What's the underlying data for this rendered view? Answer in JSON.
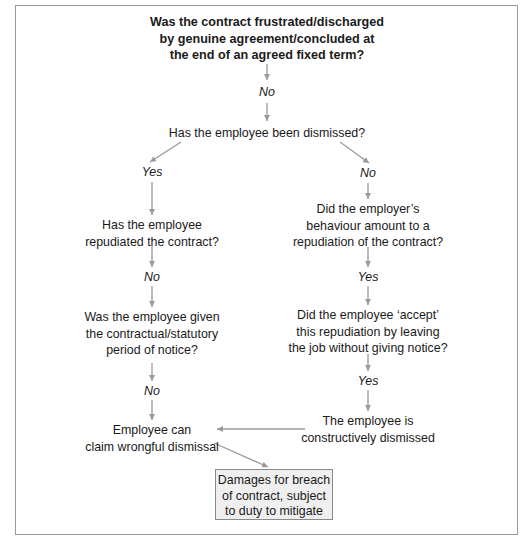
{
  "diagram": {
    "colors": {
      "arrow": "#9a9a9a",
      "box_fill": "#efefef",
      "text": "#1a1a1a",
      "frame": "#9a9a9a"
    },
    "start": {
      "lines": [
        "Was the contract frustrated/discharged",
        "by genuine agreement/concluded at",
        "the end of an agreed fixed term?"
      ]
    },
    "labels": {
      "start_no": "No",
      "dismissed_yes": "Yes",
      "dismissed_no": "No",
      "repudiated_no": "No",
      "employer_yes": "Yes",
      "notice_no": "No",
      "accept_yes": "Yes"
    },
    "nodes": {
      "dismissed": [
        "Has the employee been dismissed?"
      ],
      "repudiated": [
        "Has the employee",
        "repudiated the contract?"
      ],
      "notice": [
        "Was the employee given",
        "the contractual/statutory",
        "period of notice?"
      ],
      "wrongful": [
        "Employee can",
        "claim wrongful dismissal"
      ],
      "employer_behaviour": [
        "Did the employer’s",
        "behaviour amount to a",
        "repudiation of the contract?"
      ],
      "accept": [
        "Did the employee ‘accept’",
        "this repudiation by leaving",
        "the job without giving notice?"
      ],
      "constructive": [
        "The employee is",
        "constructively dismissed"
      ],
      "damages": [
        "Damages for breach",
        "of contract, subject",
        "to duty to mitigate"
      ]
    }
  }
}
